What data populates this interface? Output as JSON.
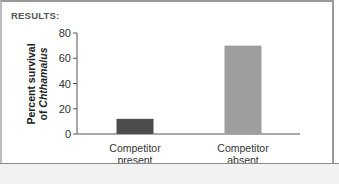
{
  "header": {
    "results_label": "RESULTS:"
  },
  "chart_data": {
    "type": "bar",
    "title": "",
    "xlabel": "",
    "ylabel_line1": "Percent survival",
    "ylabel_line2_prefix": "of ",
    "ylabel_line2_italic": "Chthamalus",
    "ylabel": "Percent survival of Chthamalus",
    "ylim": [
      0,
      80
    ],
    "yticks": [
      0,
      20,
      40,
      60,
      80
    ],
    "categories": [
      {
        "line1": "Competitor",
        "line2": "present"
      },
      {
        "line1": "Competitor",
        "line2": "absent"
      }
    ],
    "category_names": [
      "Competitor present",
      "Competitor absent"
    ],
    "values": [
      12,
      70
    ],
    "bar_colors": [
      "#4d4d4d",
      "#9e9e9e"
    ],
    "grid": false,
    "legend": "none"
  }
}
